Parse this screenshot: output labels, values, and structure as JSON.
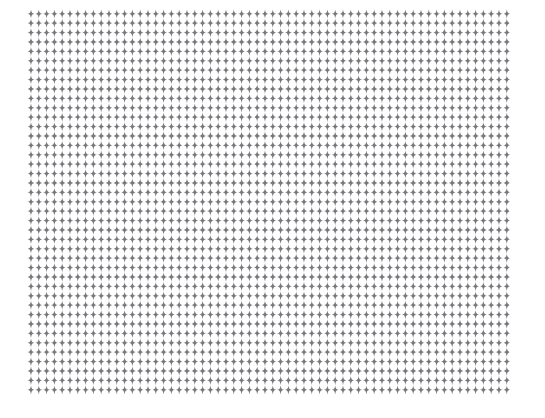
{
  "page": {
    "width": 545,
    "height": 418,
    "background_color": "#ffffff"
  },
  "pattern": {
    "name": "four-pointed-star-grid",
    "glyph_name": "four-pointed-star-icon",
    "glyph_character": "✦",
    "glyph_description": "small four-pointed star / tapered plus mark",
    "glyph_color": "#77777c",
    "columns": 62,
    "rows": 41,
    "origin_x": 31,
    "origin_y": 14,
    "spacing_x": 7.8,
    "spacing_y": 9.4,
    "glyph_width": 7,
    "glyph_height": 9,
    "total_glyphs": 2542,
    "field_left": 31,
    "field_top": 14,
    "field_right": 513,
    "field_bottom": 396
  }
}
